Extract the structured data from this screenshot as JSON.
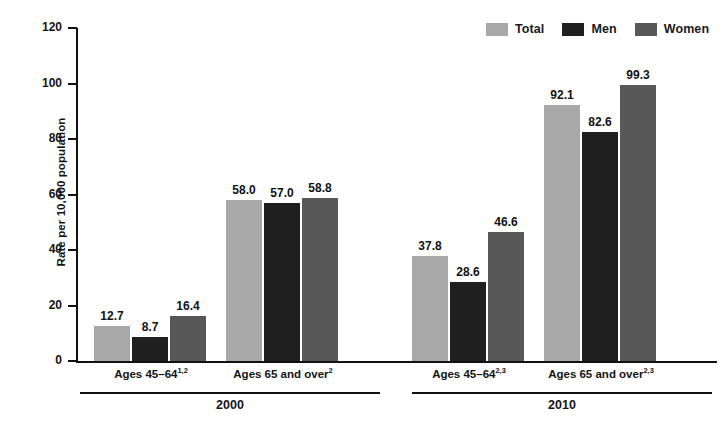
{
  "chart_data": {
    "type": "bar",
    "title": "",
    "subtitle": "",
    "xlabel": "",
    "ylabel": "Rate per 10,000 population",
    "ylim": [
      0,
      120
    ],
    "yticks": [
      0,
      20,
      40,
      60,
      80,
      100,
      120
    ],
    "ytick_labels": [
      "0",
      "20",
      "40",
      "60",
      "80",
      "100",
      "120"
    ],
    "grid": false,
    "legend_position": "top-right",
    "legend": [
      "Total",
      "Men",
      "Women"
    ],
    "series": [
      {
        "name": "Total",
        "color": "#a8a8a8",
        "values": [
          12.7,
          58.0,
          37.8,
          92.1
        ]
      },
      {
        "name": "Men",
        "color": "#201f1f",
        "values": [
          8.7,
          57.0,
          28.6,
          82.6
        ]
      },
      {
        "name": "Women",
        "color": "#585858",
        "values": [
          16.4,
          58.8,
          46.6,
          99.3
        ]
      }
    ],
    "categories": [
      {
        "label": "Ages 45–64",
        "sup": "1,2",
        "year": "2000"
      },
      {
        "label": "Ages 65 and over",
        "sup": "2",
        "year": "2000"
      },
      {
        "label": "Ages 45–64",
        "sup": "2,3",
        "year": "2010"
      },
      {
        "label": "Ages 65 and over",
        "sup": "2,3",
        "year": "2010"
      }
    ],
    "value_labels": [
      [
        "12.7",
        "8.7",
        "16.4"
      ],
      [
        "58.0",
        "57.0",
        "58.8"
      ],
      [
        "37.8",
        "28.6",
        "46.6"
      ],
      [
        "92.1",
        "82.6",
        "99.3"
      ]
    ],
    "year_groups": [
      {
        "label": "2000"
      },
      {
        "label": "2010"
      }
    ]
  }
}
